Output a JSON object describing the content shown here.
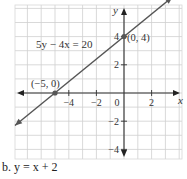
{
  "chart_data": {
    "type": "line",
    "title": "",
    "xlabel": "x",
    "ylabel": "y",
    "xlim": [
      -8,
      4.2
    ],
    "ylim": [
      -4.6,
      6.2
    ],
    "grid": true,
    "x_ticks": [
      -4,
      -2,
      0,
      2
    ],
    "x_tick_labels": [
      "−4",
      "−2",
      "0",
      "2"
    ],
    "y_ticks": [
      4,
      2,
      -2,
      -4
    ],
    "y_tick_labels": [
      "4",
      "2",
      "−2",
      "−4"
    ],
    "series": [
      {
        "name": "5y − 4x = 20",
        "equation": "5y − 4x = 20",
        "slope": 0.8,
        "intercept": 4,
        "color": "#555555",
        "endpoints": [
          [
            -7.9,
            -2.3
          ],
          [
            3.5,
            6.8
          ]
        ]
      }
    ],
    "points": [
      {
        "x": 0,
        "y": 4,
        "label": "(0, 4)"
      },
      {
        "x": -5,
        "y": 0,
        "label": "(−5, 0)"
      }
    ],
    "annotations": [
      {
        "text": "5y − 4x = 20",
        "x": -5.4,
        "y": 3
      }
    ]
  },
  "caption": "b. y = x + 2"
}
